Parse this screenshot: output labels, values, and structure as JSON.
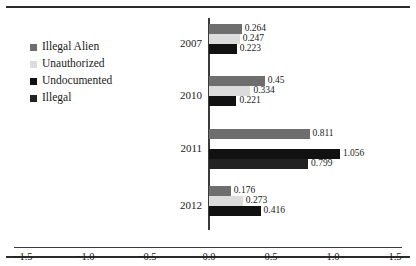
{
  "chart_data": {
    "type": "bar",
    "orientation": "horizontal",
    "title": "",
    "xlabel": "",
    "ylabel": "",
    "categories": [
      "2007",
      "2010",
      "2011",
      "2012"
    ],
    "xlim": [
      -1.5,
      1.5
    ],
    "xticks": [
      -1.5,
      -1.0,
      -0.5,
      0.0,
      0.5,
      1.0,
      1.5
    ],
    "xtick_labels": [
      "−1.5",
      "−1.0",
      "−0.5",
      "0.0",
      "0.5",
      "1.0",
      "1.5"
    ],
    "grid": false,
    "legend_position": "left",
    "series": [
      {
        "name": "Illegal Alien",
        "color": "#6e6e6e",
        "values": [
          0.264,
          0.45,
          0.811,
          0.176
        ],
        "labels": [
          "0.264",
          "0.45",
          "0.811",
          "0.176"
        ]
      },
      {
        "name": "Unauthorized",
        "color": "#dcdcdc",
        "values": [
          0.247,
          0.334,
          0.0,
          0.273
        ],
        "labels": [
          "0.247",
          "0.334",
          "",
          "0.273"
        ]
      },
      {
        "name": "Undocumented",
        "color": "#111111",
        "values": [
          0.223,
          0.221,
          1.056,
          0.416
        ],
        "labels": [
          "0.223",
          "0.221",
          "1.056",
          "0.416"
        ]
      },
      {
        "name": "Illegal",
        "color": "#222222",
        "values": [
          0.0,
          0.0,
          0.799,
          0.0
        ],
        "labels": [
          "",
          "",
          "0.799",
          ""
        ]
      }
    ]
  },
  "legend": {
    "items": [
      {
        "label": "Illegal Alien",
        "color": "#6e6e6e"
      },
      {
        "label": "Unauthorized",
        "color": "#dcdcdc"
      },
      {
        "label": "Undocumented",
        "color": "#111111"
      },
      {
        "label": "Illegal",
        "color": "#222222"
      }
    ]
  }
}
